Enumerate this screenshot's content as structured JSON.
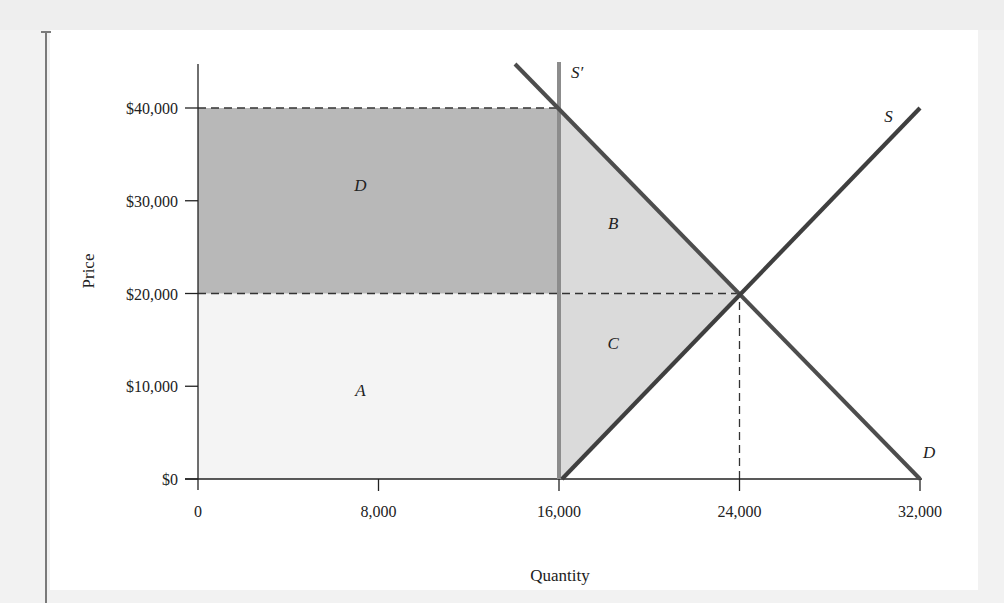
{
  "chart_data": {
    "type": "line",
    "subtype": "supply-demand-diagram",
    "title": "",
    "xlabel": "Quantity",
    "ylabel": "Price",
    "xlim": [
      0,
      32000
    ],
    "ylim": [
      0,
      40000
    ],
    "x_ticks": [
      0,
      8000,
      16000,
      24000,
      32000
    ],
    "x_tick_labels": [
      "0",
      "8,000",
      "16,000",
      "24,000",
      "32,000"
    ],
    "y_ticks": [
      0,
      10000,
      20000,
      30000,
      40000
    ],
    "y_tick_labels": [
      "$0",
      "$10,000",
      "$20,000",
      "$30,000",
      "$40,000"
    ],
    "grid": false,
    "legend": null,
    "series": [
      {
        "name": "D",
        "label": "D",
        "kind": "demand",
        "points": [
          [
            14000,
            45000
          ],
          [
            32000,
            0
          ]
        ],
        "color": "#4d4d4d"
      },
      {
        "name": "S",
        "label": "S",
        "kind": "supply",
        "points": [
          [
            16000,
            0
          ],
          [
            32000,
            40000
          ]
        ],
        "color": "#3f3f3f"
      },
      {
        "name": "S'",
        "label": "S′",
        "kind": "restricted-supply",
        "points": [
          [
            16000,
            0
          ],
          [
            16000,
            45000
          ]
        ],
        "color": "#8c8c8c"
      }
    ],
    "reference_lines": [
      {
        "type": "horizontal-dashed",
        "y": 40000,
        "x_from": 0,
        "x_to": 16000
      },
      {
        "type": "horizontal-dashed",
        "y": 20000,
        "x_from": 0,
        "x_to": 24000
      },
      {
        "type": "vertical-dashed",
        "x": 24000,
        "y_from": 0,
        "y_to": 20000
      }
    ],
    "equilibrium": {
      "quantity": 24000,
      "price": 20000
    },
    "restricted_equilibrium": {
      "quantity": 16000,
      "price": 40000
    },
    "regions": [
      {
        "label": "A",
        "polygon": [
          [
            0,
            0
          ],
          [
            16000,
            0
          ],
          [
            16000,
            20000
          ],
          [
            0,
            20000
          ]
        ],
        "fill": "#f4f4f4",
        "label_pos": [
          7200,
          9000
        ]
      },
      {
        "label": "D",
        "polygon": [
          [
            0,
            20000
          ],
          [
            16000,
            20000
          ],
          [
            16000,
            40000
          ],
          [
            0,
            40000
          ]
        ],
        "fill": "#b8b8b8",
        "label_pos": [
          7200,
          31000
        ]
      },
      {
        "label": "B",
        "polygon": [
          [
            16000,
            20000
          ],
          [
            24000,
            20000
          ],
          [
            16000,
            40000
          ]
        ],
        "fill": "#dadada",
        "label_pos": [
          18400,
          27000
        ]
      },
      {
        "label": "C",
        "polygon": [
          [
            16000,
            0
          ],
          [
            24000,
            20000
          ],
          [
            16000,
            20000
          ]
        ],
        "fill": "#dadada",
        "label_pos": [
          18400,
          14000
        ]
      }
    ],
    "annotations": [
      {
        "text": "S′",
        "x": 16800,
        "y": 43200
      },
      {
        "text": "S",
        "x": 30600,
        "y": 38500
      },
      {
        "text": "D",
        "x": 32400,
        "y": 2300
      }
    ]
  }
}
